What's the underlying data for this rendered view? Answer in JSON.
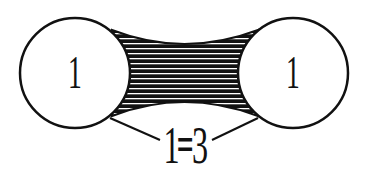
{
  "diagram": {
    "left_node": {
      "label": "1"
    },
    "right_node": {
      "label": "1"
    },
    "equation": {
      "left": "1",
      "op": "=",
      "right": "3"
    },
    "colors": {
      "stroke": "#111111",
      "background": "#ffffff"
    }
  }
}
